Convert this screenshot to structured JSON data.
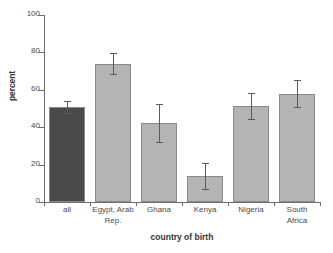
{
  "chart_data": {
    "type": "bar",
    "title": "",
    "xlabel": "country of birth",
    "ylabel": "percent",
    "categories": [
      "all",
      "Egypt, Arab Rep.",
      "Ghana",
      "Kenya",
      "Nigeria",
      "South Africa"
    ],
    "values": [
      50.8,
      74.0,
      42.0,
      14.0,
      51.5,
      58.0
    ],
    "error_low": [
      47.5,
      68.5,
      32.0,
      7.0,
      44.5,
      51.0
    ],
    "error_high": [
      54.0,
      79.5,
      52.5,
      21.0,
      58.5,
      65.0
    ],
    "ylim": [
      0,
      100
    ],
    "yticks": [
      0,
      20,
      40,
      60,
      80,
      100
    ],
    "ytick_labels": [
      "0",
      "20",
      "40",
      "60",
      "80",
      "100"
    ],
    "grid": false,
    "legend": "none",
    "bar_colors": [
      "#4a4a4a",
      "#b4b4b4",
      "#b4b4b4",
      "#b4b4b4",
      "#b4b4b4",
      "#b4b4b4"
    ],
    "bar_edge_color": "#8a8a8a",
    "error_color": "#5a5a5a",
    "axis_color": "#6e6e6e",
    "background": "#ffffff"
  },
  "labels": {
    "cat_0": "all",
    "cat_1": "Egypt, Arab\nRep.",
    "cat_2": "Ghana",
    "cat_3": "Kenya",
    "cat_4": "Nigeria",
    "cat_5": "South\nAfrica"
  },
  "yticks": {
    "t0": "0",
    "t1": "20",
    "t2": "40",
    "t3": "60",
    "t4": "80",
    "t5": "100"
  }
}
